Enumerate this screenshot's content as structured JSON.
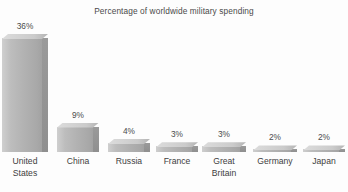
{
  "chart_data": {
    "type": "bar",
    "title": "Percentage of worldwide military spending",
    "xlabel": "",
    "ylabel": "",
    "ylim": [
      0,
      36
    ],
    "grid": false,
    "legend": null,
    "categories": [
      "United States",
      "China",
      "Russia",
      "France",
      "Great Britain",
      "Germany",
      "Japan"
    ],
    "category_lines": [
      "United\nStates",
      "China",
      "Russia",
      "France",
      "Great\nBritain",
      "Germany",
      "Japan"
    ],
    "values": [
      36,
      9,
      4,
      3,
      3,
      2,
      2
    ],
    "value_labels": [
      "36%",
      "9%",
      "4%",
      "3%",
      "3%",
      "2%",
      "2%"
    ],
    "units": "percent",
    "bar_style": "3d-extruded",
    "colors": {
      "bar_front_light": "#cfcfcf",
      "bar_front_dark": "#a2a2a2",
      "bar_side": "#93",
      "bar_top": "#dcdcdc",
      "background": "#fdfdfd",
      "text": "#404040",
      "title_text": "#4a4a4a"
    }
  }
}
